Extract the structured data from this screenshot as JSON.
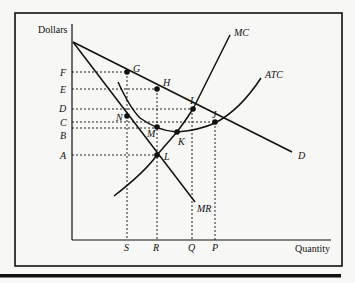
{
  "diagram": {
    "type": "monopoly cost-revenue diagram",
    "y_axis_label": "Dollars",
    "x_axis_label": "Quantity",
    "price_levels": [
      {
        "label": "F",
        "y": 72
      },
      {
        "label": "E",
        "y": 89
      },
      {
        "label": "D",
        "y": 109
      },
      {
        "label": "C",
        "y": 122
      },
      {
        "label": "B",
        "y": 128
      },
      {
        "label": "A",
        "y": 155
      }
    ],
    "quantity_levels": [
      {
        "label": "S",
        "x": 127
      },
      {
        "label": "R",
        "x": 157
      },
      {
        "label": "Q",
        "x": 192
      },
      {
        "label": "P",
        "x": 215
      }
    ],
    "curves": [
      {
        "label": "MC"
      },
      {
        "label": "ATC"
      },
      {
        "label": "D"
      },
      {
        "label": "MR"
      }
    ],
    "points": [
      {
        "label": "G"
      },
      {
        "label": "H"
      },
      {
        "label": "I"
      },
      {
        "label": "J"
      },
      {
        "label": "K"
      },
      {
        "label": "L"
      },
      {
        "label": "M"
      },
      {
        "label": "N"
      }
    ]
  }
}
